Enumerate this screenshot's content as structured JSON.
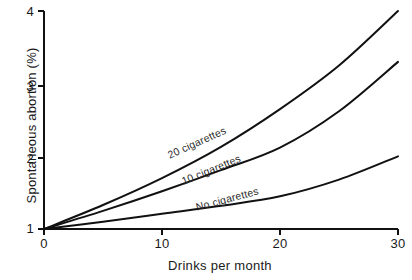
{
  "chart_data": {
    "type": "line",
    "title": "",
    "subtitle": "",
    "xlabel": "Drinks per month",
    "ylabel": "Spontaneous abortion (%)",
    "xlim": [
      0,
      30
    ],
    "ylim": [
      1,
      4
    ],
    "xticks": [
      0,
      10,
      20,
      30
    ],
    "xticklabels": [
      "0",
      "10",
      "20",
      "30"
    ],
    "yticks": [
      1,
      2,
      3,
      4
    ],
    "yticklabels": [
      "1",
      "2",
      "3",
      "4"
    ],
    "grid": false,
    "legend": "inline-curve-labels",
    "x": [
      0,
      5,
      10,
      15,
      20,
      25,
      30
    ],
    "series": [
      {
        "name": "20 cigarettes",
        "label": "20 cigarettes",
        "color": "#111111",
        "values": [
          1.0,
          1.33,
          1.7,
          2.13,
          2.65,
          3.25,
          4.0
        ]
      },
      {
        "name": "10 cigarettes",
        "label": "10 cigarettes",
        "color": "#111111",
        "values": [
          1.0,
          1.25,
          1.52,
          1.81,
          2.12,
          2.62,
          3.3
        ]
      },
      {
        "name": "No cigarettes",
        "label": "No cigarettes",
        "color": "#111111",
        "values": [
          1.0,
          1.1,
          1.21,
          1.32,
          1.45,
          1.68,
          2.0
        ]
      }
    ]
  },
  "axes": {
    "y_title": "Spontaneous abortion (%)",
    "x_title": "Drinks per month",
    "y_tick_4": "4",
    "y_tick_3": "3",
    "y_tick_2": "2",
    "y_tick_1": "1",
    "x_tick_0": "0",
    "x_tick_10": "10",
    "x_tick_20": "20",
    "x_tick_30": "30"
  },
  "curve_labels": {
    "twenty": "20 cigarettes",
    "ten": "10 cigarettes",
    "none": "No cigarettes"
  },
  "colors": {
    "line": "#111111",
    "axis": "#111111",
    "background": "#ffffff",
    "text": "#1a1a1a"
  }
}
